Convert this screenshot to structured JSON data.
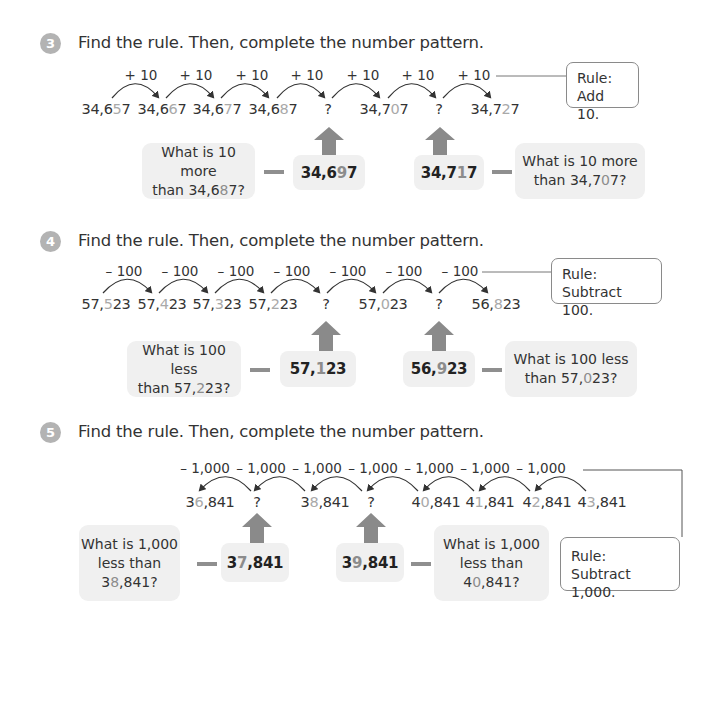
{
  "problems": [
    {
      "number": "3",
      "instruction": "Find the rule. Then, complete the number pattern.",
      "operation_label": "+ 10",
      "direction": "forward",
      "terms": [
        {
          "pre": "34,6",
          "hl": "5",
          "post": "7"
        },
        {
          "pre": "34,6",
          "hl": "6",
          "post": "7"
        },
        {
          "pre": "34,6",
          "hl": "7",
          "post": "7"
        },
        {
          "pre": "34,6",
          "hl": "8",
          "post": "7"
        },
        {
          "pre": "",
          "hl": "",
          "post": "?"
        },
        {
          "pre": "34,7",
          "hl": "0",
          "post": "7"
        },
        {
          "pre": "",
          "hl": "",
          "post": "?"
        },
        {
          "pre": "34,7",
          "hl": "2",
          "post": "7"
        }
      ],
      "rule": {
        "line1": "Rule:",
        "line2": "Add 10."
      },
      "answers": [
        {
          "pre": "34,6",
          "hl": "9",
          "post": "7",
          "question_pre": "What is 10 more",
          "question_mid": "than 34,6",
          "question_hl": "8",
          "question_post": "7?"
        },
        {
          "pre": "34,7",
          "hl": "1",
          "post": "7",
          "question_pre": "What is 10 more",
          "question_mid": "than 34,7",
          "question_hl": "0",
          "question_post": "7?"
        }
      ]
    },
    {
      "number": "4",
      "instruction": "Find the rule. Then, complete the number pattern.",
      "operation_label": "– 100",
      "direction": "forward",
      "terms": [
        {
          "pre": "57,",
          "hl": "5",
          "post": "23"
        },
        {
          "pre": "57,",
          "hl": "4",
          "post": "23"
        },
        {
          "pre": "57,",
          "hl": "3",
          "post": "23"
        },
        {
          "pre": "57,",
          "hl": "2",
          "post": "23"
        },
        {
          "pre": "",
          "hl": "",
          "post": "?"
        },
        {
          "pre": "57,",
          "hl": "0",
          "post": "23"
        },
        {
          "pre": "",
          "hl": "",
          "post": "?"
        },
        {
          "pre": "56,",
          "hl": "8",
          "post": "23"
        }
      ],
      "rule": {
        "line1": "Rule:",
        "line2": "Subtract 100."
      },
      "answers": [
        {
          "pre": "57,",
          "hl": "1",
          "post": "23",
          "question_pre": "What is 100 less",
          "question_mid": "than 57,",
          "question_hl": "2",
          "question_post": "23?"
        },
        {
          "pre": "56,",
          "hl": "9",
          "post": "23",
          "question_pre": "What is 100 less",
          "question_mid": "than 57,",
          "question_hl": "0",
          "question_post": "23?"
        }
      ]
    },
    {
      "number": "5",
      "instruction": "Find the rule. Then, complete the number pattern.",
      "operation_label": "– 1,000",
      "direction": "backward",
      "terms": [
        {
          "pre": "3",
          "hl": "6",
          "post": ",841"
        },
        {
          "pre": "",
          "hl": "",
          "post": "?"
        },
        {
          "pre": "3",
          "hl": "8",
          "post": ",841"
        },
        {
          "pre": "",
          "hl": "",
          "post": "?"
        },
        {
          "pre": "4",
          "hl": "0",
          "post": ",841"
        },
        {
          "pre": "4",
          "hl": "1",
          "post": ",841"
        },
        {
          "pre": "4",
          "hl": "2",
          "post": ",841"
        },
        {
          "pre": "4",
          "hl": "3",
          "post": ",841"
        }
      ],
      "rule": {
        "line1": "Rule:",
        "line2": "Subtract 1,000."
      },
      "answers": [
        {
          "pre": "3",
          "hl": "7",
          "post": ",841",
          "question_l1": "What is 1,000",
          "question_l2": "less than",
          "question_pre3": "3",
          "question_hl": "8",
          "question_post3": ",841?"
        },
        {
          "pre": "3",
          "hl": "9",
          "post": ",841",
          "question_l1": "What is 1,000",
          "question_l2": "less than",
          "question_pre3": "4",
          "question_hl": "0",
          "question_post3": ",841?"
        }
      ]
    }
  ]
}
